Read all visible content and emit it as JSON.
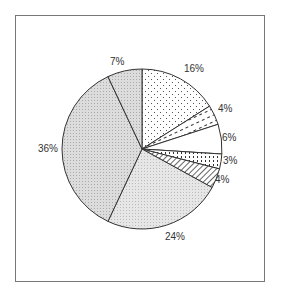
{
  "chart_data": {
    "type": "pie",
    "title": "",
    "start_angle_deg": 0,
    "direction": "clockwise",
    "categories": [
      "Slice 1",
      "Slice 2",
      "Slice 3",
      "Slice 4",
      "Slice 5",
      "Slice 6",
      "Slice 7",
      "Slice 8"
    ],
    "values": [
      16,
      4,
      6,
      3,
      4,
      24,
      36,
      7
    ],
    "labels": [
      "16%",
      "4%",
      "6%",
      "3%",
      "4%",
      "24%",
      "36%",
      "7%"
    ],
    "fills": [
      "dots",
      "dashes-diagonal",
      "white",
      "dots-dense",
      "hatch-diagonal",
      "light-gray-stipple",
      "gray-stipple",
      "gray-stipple"
    ],
    "legend": null
  },
  "labels": {
    "l0": "16%",
    "l1": "4%",
    "l2": "6%",
    "l3": "3%",
    "l4": "4%",
    "l5": "24%",
    "l6": "36%",
    "l7": "7%"
  }
}
